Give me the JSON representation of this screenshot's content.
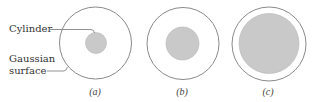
{
  "labels": {
    "cylinder": "Cylinder",
    "gaussian_line1": "Gaussian",
    "gaussian_line2": "surface"
  },
  "panels": [
    {
      "caption": "(a)",
      "outer": {
        "cx": 95.5,
        "cy": 43,
        "r": 36
      },
      "inner": {
        "cx": 96,
        "cy": 43,
        "r": 10.5
      }
    },
    {
      "caption": "(b)",
      "outer": {
        "cx": 183,
        "cy": 43.5,
        "r": 36
      },
      "inner": {
        "cx": 182.5,
        "cy": 43.5,
        "r": 16.5
      }
    },
    {
      "caption": "(c)",
      "outer": {
        "cx": 269,
        "cy": 44,
        "r": 37
      },
      "inner": {
        "cx": 269,
        "cy": 43.5,
        "r": 30
      }
    }
  ],
  "colors": {
    "outline": "#8a8a8a",
    "fill": "#c9c9c9",
    "leader": "#777777"
  }
}
